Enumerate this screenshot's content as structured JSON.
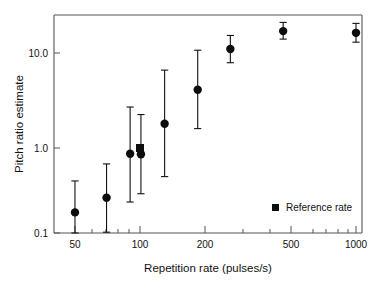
{
  "chart_data": {
    "type": "scatter",
    "title": "",
    "xlabel": "Repetition rate (pulses/s)",
    "ylabel": "Pitch ratio estimate",
    "xscale": "log",
    "yscale": "log",
    "xlim": [
      40,
      1150
    ],
    "ylim": [
      0.1,
      25
    ],
    "grid": false,
    "xticks_major": [
      50,
      100,
      200,
      500,
      1000
    ],
    "xtick_labels": [
      "50",
      "100",
      "200",
      "500",
      "1000"
    ],
    "xticks_minor": [
      60,
      70,
      80,
      90,
      300,
      400,
      600,
      700,
      800,
      900
    ],
    "yticks_major": [
      0.1,
      1.0,
      10.0
    ],
    "ytick_labels": [
      "0.1",
      "1.0",
      "10.0"
    ],
    "marker_color": "#0d0d0d",
    "error_color": "#111111",
    "axis_color": "#555555",
    "legend": {
      "position": "lower-right",
      "entries": [
        {
          "label": "Reference rate",
          "marker": "square",
          "color": "#0d0d0d"
        }
      ]
    },
    "series": [
      {
        "name": "Pitch ratio estimate",
        "marker": "circle",
        "points": [
          {
            "x": 50,
            "y": 0.21,
            "y_low": 0.1,
            "y_high": 0.45
          },
          {
            "x": 70,
            "y": 0.3,
            "y_low": 0.13,
            "y_high": 0.68
          },
          {
            "x": 90,
            "y": 0.87,
            "y_low": 0.27,
            "y_high": 2.7
          },
          {
            "x": 101,
            "y": 0.86,
            "y_low": 0.33,
            "y_high": 2.25
          },
          {
            "x": 130,
            "y": 1.8,
            "y_low": 0.5,
            "y_high": 6.6
          },
          {
            "x": 185,
            "y": 4.1,
            "y_low": 1.6,
            "y_high": 10.7
          },
          {
            "x": 262,
            "y": 11.0,
            "y_low": 7.9,
            "y_high": 15.3
          },
          {
            "x": 460,
            "y": 17.0,
            "y_low": 14.0,
            "y_high": 21.0
          },
          {
            "x": 1000,
            "y": 16.3,
            "y_low": 13.0,
            "y_high": 20.5
          }
        ]
      },
      {
        "name": "Reference rate",
        "marker": "square",
        "points": [
          {
            "x": 100,
            "y": 1.0,
            "y_low": null,
            "y_high": null
          }
        ]
      }
    ]
  },
  "axes": {
    "x_title": "Repetition rate (pulses/s)",
    "y_title": "Pitch ratio estimate"
  },
  "legend": {
    "reference_label": "Reference rate"
  },
  "tick_text": {
    "x": [
      "50",
      "100",
      "200",
      "500",
      "1000"
    ],
    "y": [
      "10.0",
      "1.0",
      "0.1"
    ]
  }
}
